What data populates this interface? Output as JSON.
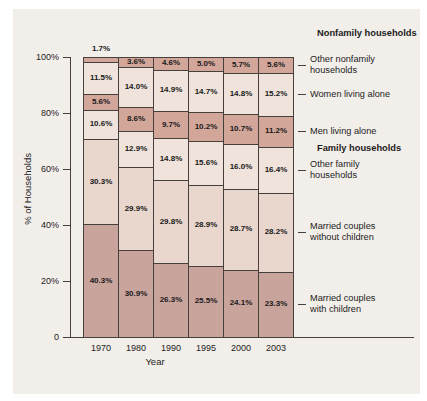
{
  "figure": {
    "panel_bg": "#f2eeea",
    "line_color": "#45403c",
    "text_color": "#1c1c1c"
  },
  "chart_data": {
    "type": "bar",
    "stacked": true,
    "title": "",
    "xlabel": "Year",
    "ylabel": "% of Households",
    "ylim": [
      0,
      100
    ],
    "grid": false,
    "legend_position": "right",
    "y_ticks": [
      {
        "value": 100,
        "label": "100%"
      },
      {
        "value": 80,
        "label": "80%"
      },
      {
        "value": 60,
        "label": "60%"
      },
      {
        "value": 40,
        "label": "40%"
      },
      {
        "value": 20,
        "label": "20%"
      },
      {
        "value": 0,
        "label": "0"
      }
    ],
    "categories": [
      "1970",
      "1980",
      "1990",
      "1995",
      "2000",
      "2003"
    ],
    "series": [
      {
        "name": "Married couples with children",
        "label_lines": [
          "Married couples",
          "with children"
        ],
        "values": [
          40.3,
          30.9,
          26.3,
          25.5,
          24.1,
          23.3
        ],
        "color": "#c9a49d"
      },
      {
        "name": "Married couples without children",
        "label_lines": [
          "Married couples",
          "without children"
        ],
        "values": [
          30.3,
          29.9,
          29.8,
          28.9,
          28.7,
          28.2
        ],
        "color": "#e9d6cd"
      },
      {
        "name": "Other family households",
        "label_lines": [
          "Other family",
          "households"
        ],
        "values": [
          10.6,
          12.9,
          14.8,
          15.6,
          16.0,
          16.4
        ],
        "color": "#efe3db"
      },
      {
        "name": "Men living alone",
        "label_lines": [
          "Men living alone"
        ],
        "values": [
          5.6,
          8.6,
          9.7,
          10.2,
          10.7,
          11.2
        ],
        "color": "#d3a69a"
      },
      {
        "name": "Women living alone",
        "label_lines": [
          "Women living alone"
        ],
        "values": [
          11.5,
          14.0,
          14.9,
          14.7,
          14.8,
          15.2
        ],
        "color": "#efe3db"
      },
      {
        "name": "Other nonfamily households",
        "label_lines": [
          "Other nonfamily",
          "households"
        ],
        "values": [
          1.7,
          3.6,
          4.6,
          5.0,
          5.7,
          5.6
        ],
        "color": "#d3a69a"
      }
    ],
    "group_headers": [
      {
        "label": "Nonfamily households",
        "group": "nonfamily"
      },
      {
        "label": "Family households",
        "group": "family"
      }
    ]
  }
}
